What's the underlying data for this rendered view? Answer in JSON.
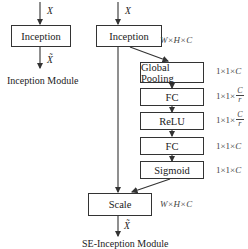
{
  "left_module": {
    "input_label": "X",
    "block": "Inception",
    "output_label": "X̃",
    "caption": "Inception Module"
  },
  "right_module": {
    "input_label": "X",
    "inception": {
      "label": "Inception",
      "dim": "W×H×C"
    },
    "blocks": [
      {
        "label": "Global Pooling",
        "dim_prefix": "1×1×",
        "dim_var": "C",
        "dim_frac": null
      },
      {
        "label": "FC",
        "dim_prefix": "1×1×",
        "dim_var": null,
        "dim_frac": {
          "num": "C",
          "den": "r"
        }
      },
      {
        "label": "ReLU",
        "dim_prefix": "1×1×",
        "dim_var": null,
        "dim_frac": {
          "num": "C",
          "den": "r"
        }
      },
      {
        "label": "FC",
        "dim_prefix": "1×1×",
        "dim_var": "C",
        "dim_frac": null
      },
      {
        "label": "Sigmoid",
        "dim_prefix": "1×1×",
        "dim_var": "C",
        "dim_frac": null
      }
    ],
    "scale": {
      "label": "Scale",
      "dim": "W×H×C"
    },
    "output_label": "X̃",
    "caption": "SE-Inception Module"
  }
}
